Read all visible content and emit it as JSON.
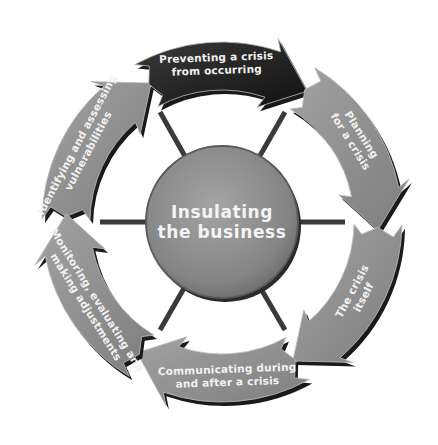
{
  "diagram": {
    "center": {
      "line1": "Insulating",
      "line2": "the business"
    },
    "stages": [
      {
        "id": "identify",
        "line1": "Identifying and assessing",
        "line2": "vulnerabilities",
        "color": "#8e8e8e"
      },
      {
        "id": "prevent",
        "line1": "Preventing a crisis",
        "line2": "from occurring",
        "color": "#262626"
      },
      {
        "id": "plan",
        "line1": "Planning",
        "line2": "for a crisis",
        "color": "#8e8e8e"
      },
      {
        "id": "crisis",
        "line1": "The crisis",
        "line2": "itself",
        "color": "#8e8e8e"
      },
      {
        "id": "communicate",
        "line1": "Communicating during",
        "line2": "and after a crisis",
        "color": "#8e8e8e"
      },
      {
        "id": "monitor",
        "line1": "Monitoring, evaluating and",
        "line2": "making adjustments",
        "color": "#8e8e8e"
      }
    ],
    "colors": {
      "arrow_fill": "#8e8e8e",
      "highlight_fill": "#262626",
      "shadow": "#1a1a1a",
      "center_fill": "#8a8a8a",
      "spoke": "#3a3a3a"
    }
  }
}
